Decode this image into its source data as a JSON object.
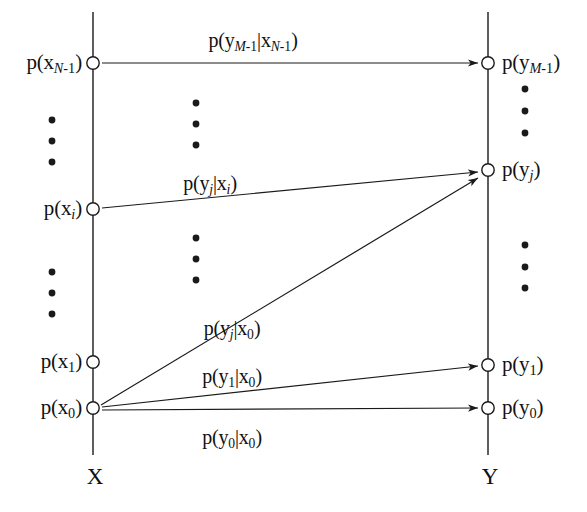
{
  "figure": {
    "background_color": "#ffffff",
    "line_color": "#1a1a1a",
    "node_fill_color": "#ffffff",
    "text_color": "#111111",
    "width": 587,
    "height": 512
  },
  "axes": {
    "left": {
      "name": "X",
      "x": 93,
      "top": 12,
      "bottom": 455,
      "label_x": 95,
      "label_y": 477
    },
    "right": {
      "name": "Y",
      "x": 488,
      "top": 12,
      "bottom": 455,
      "label_x": 490,
      "label_y": 477
    }
  },
  "input_nodes": [
    {
      "id": "x_N_1",
      "label_html": "p(x<sub class=\"it\">N</sub><sub>-1</sub>)",
      "label_text": "p(x_N-1)",
      "x": 93,
      "y": 63,
      "label_x": 82,
      "label_y": 62
    },
    {
      "id": "x_i",
      "label_html": "p(x<sub class=\"it\">i</sub>)",
      "label_text": "p(x_i)",
      "x": 93,
      "y": 209,
      "label_x": 82,
      "label_y": 208
    },
    {
      "id": "x_1",
      "label_html": "p(x<sub>1</sub>)",
      "label_text": "p(x_1)",
      "x": 93,
      "y": 362,
      "label_x": 82,
      "label_y": 361
    },
    {
      "id": "x_0",
      "label_html": "p(x<sub>0</sub>)",
      "label_text": "p(x_0)",
      "x": 93,
      "y": 408,
      "label_x": 82,
      "label_y": 407
    }
  ],
  "output_nodes": [
    {
      "id": "y_M_1",
      "label_html": "p(y<sub class=\"it\">M</sub><sub>-1</sub>)",
      "label_text": "p(y_M-1)",
      "x": 488,
      "y": 63,
      "label_x": 502,
      "label_y": 62
    },
    {
      "id": "y_j",
      "label_html": "p(y<sub class=\"it\">j</sub>)",
      "label_text": "p(y_j)",
      "x": 488,
      "y": 170,
      "label_x": 502,
      "label_y": 169
    },
    {
      "id": "y_1",
      "label_html": "p(y<sub>1</sub>)",
      "label_text": "p(y_1)",
      "x": 488,
      "y": 365,
      "label_x": 502,
      "label_y": 364
    },
    {
      "id": "y_0",
      "label_html": "p(y<sub>0</sub>)",
      "label_text": "p(y_0)",
      "x": 488,
      "y": 408,
      "label_x": 502,
      "label_y": 407
    }
  ],
  "edges": [
    {
      "id": "e_top",
      "from": "x_N_1",
      "to": "y_M_1",
      "x1": 102,
      "y1": 63,
      "x2": 478,
      "y2": 63,
      "label_html": "p(y<sub class=\"it\">M</sub><sub>-1</sub>|x<sub class=\"it\">N</sub><sub>-1</sub>)",
      "label_text": "p(y_M-1|x_N-1)",
      "label_x": 253,
      "label_y": 40
    },
    {
      "id": "e_xi_yj",
      "from": "x_i",
      "to": "y_j",
      "x1": 102,
      "y1": 208,
      "x2": 478,
      "y2": 172,
      "label_html": "p(y<sub class=\"it\">j</sub>|x<sub class=\"it\">i</sub>)",
      "label_text": "p(y_j|x_i)",
      "label_x": 210,
      "label_y": 183
    },
    {
      "id": "e_x0_yj",
      "from": "x_0",
      "to": "y_j",
      "x1": 101,
      "y1": 405,
      "x2": 478,
      "y2": 178,
      "label_html": "p(y<sub class=\"it\">j</sub>|x<sub>0</sub>)",
      "label_text": "p(y_j|x_0)",
      "label_x": 232,
      "label_y": 328
    },
    {
      "id": "e_x0_y1",
      "from": "x_0",
      "to": "y_1",
      "x1": 102,
      "y1": 407,
      "x2": 478,
      "y2": 366,
      "label_html": "p(y<sub>1</sub>|x<sub>0</sub>)",
      "label_text": "p(y_1|x_0)",
      "label_x": 232,
      "label_y": 376
    },
    {
      "id": "e_x0_y0",
      "from": "x_0",
      "to": "y_0",
      "x1": 102,
      "y1": 410,
      "x2": 478,
      "y2": 408,
      "label_html": "p(y<sub>0</sub>|x<sub>0</sub>)",
      "label_text": "p(y_0|x_0)",
      "label_x": 232,
      "label_y": 437
    }
  ],
  "ellipses": [
    {
      "id": "left-upper",
      "x": 52,
      "ys": [
        120,
        141,
        162
      ]
    },
    {
      "id": "left-lower",
      "x": 52,
      "ys": [
        272,
        293,
        314
      ]
    },
    {
      "id": "mid-upper",
      "x": 196,
      "ys": [
        103,
        124,
        145
      ]
    },
    {
      "id": "mid-lower",
      "x": 196,
      "ys": [
        238,
        259,
        280
      ]
    },
    {
      "id": "right-upper",
      "x": 525,
      "ys": [
        89,
        111,
        133
      ]
    },
    {
      "id": "right-lower",
      "x": 525,
      "ys": [
        245,
        267,
        288
      ]
    }
  ]
}
